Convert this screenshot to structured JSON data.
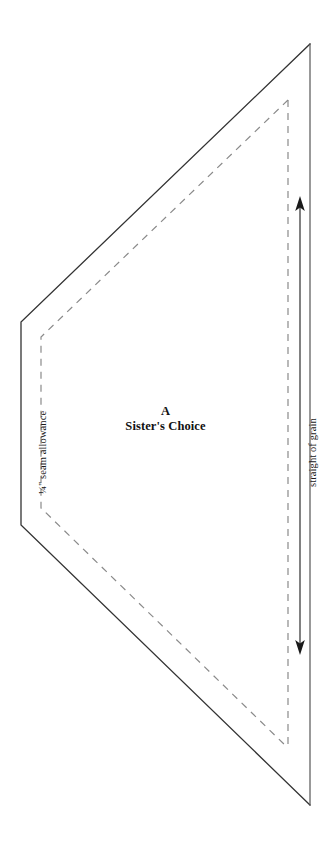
{
  "document": {
    "type": "quilt-pattern-template",
    "background_color": "#ffffff"
  },
  "template": {
    "piece_letter": "A",
    "block_name": "Sister's Choice",
    "seam_allowance_label": "¼\" seam allowance",
    "grain_label": "straight of grain"
  },
  "lines": {
    "cutting_line": {
      "name": "cutting-line",
      "style": "solid",
      "color": "#333333",
      "width": 1.3,
      "points": "310,44 21,322 21,525 310,805"
    },
    "seam_line": {
      "name": "seam-line",
      "style": "dashed",
      "color": "#8a8a8a",
      "width": 1.2,
      "dash": "7,6",
      "points": "288,100 41,337 41,508 288,748"
    },
    "right_edge": {
      "name": "right-edge",
      "color": "#555555",
      "x": 310,
      "y1": 44,
      "y2": 805
    }
  },
  "grain_arrow": {
    "name": "grain-arrow",
    "color": "#1a1a1a",
    "x": 300,
    "y_top": 197,
    "y_bottom": 653,
    "double_headed": true
  },
  "icons": {
    "arrow_up": "arrow-up-icon",
    "arrow_down": "arrow-down-icon"
  }
}
